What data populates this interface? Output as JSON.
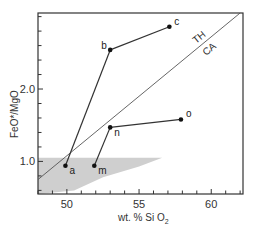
{
  "chart_data": {
    "type": "scatter",
    "title": "",
    "xlabel": "wt. % SiO2",
    "ylabel": "FeO*/MgO",
    "xlim": [
      48,
      62.2
    ],
    "ylim": [
      0.55,
      3.05
    ],
    "x_ticks": {
      "major": [
        50,
        55,
        60
      ],
      "minor_step": 1
    },
    "y_ticks": {
      "major": [
        1.0,
        2.0
      ],
      "minor_step": 0.2
    },
    "tick_labels": {
      "x": [
        "50",
        "55",
        "60"
      ],
      "y": [
        "1.0",
        "2.0"
      ]
    },
    "grid": false,
    "legend": null,
    "points": [
      {
        "label": "a",
        "x": 49.9,
        "y": 0.94
      },
      {
        "label": "b",
        "x": 53.0,
        "y": 2.54
      },
      {
        "label": "c",
        "x": 57.1,
        "y": 2.86
      },
      {
        "label": "m",
        "x": 51.9,
        "y": 0.94
      },
      {
        "label": "n",
        "x": 53.0,
        "y": 1.47
      },
      {
        "label": "o",
        "x": 57.9,
        "y": 1.58
      }
    ],
    "segments": [
      {
        "from": "a",
        "to": "b"
      },
      {
        "from": "b",
        "to": "c"
      },
      {
        "from": "m",
        "to": "n"
      },
      {
        "from": "n",
        "to": "o"
      }
    ],
    "divider_line": {
      "labels": [
        "TH",
        "CA"
      ],
      "from": {
        "x": 48.0,
        "y": 0.75
      },
      "to": {
        "x": 62.0,
        "y": 3.05
      }
    },
    "shaded_field": {
      "description": "stippled field, FeO*/MgO below ~1.05, tapering toward higher SiO2",
      "approx_outline": [
        [
          48.0,
          1.05
        ],
        [
          56.6,
          1.05
        ],
        [
          55.0,
          0.93
        ],
        [
          52.5,
          0.78
        ],
        [
          50.5,
          0.6
        ],
        [
          48.0,
          0.55
        ]
      ]
    }
  },
  "axes": {
    "x_title_main": "wt. % Si O",
    "x_title_sub": "2",
    "y_title": "FeO*/MgO"
  },
  "field_labels": {
    "upper": "TH",
    "lower": "CA"
  },
  "colors": {
    "line": "#333333",
    "shade": "#cfcfcf",
    "point": "#111111"
  }
}
